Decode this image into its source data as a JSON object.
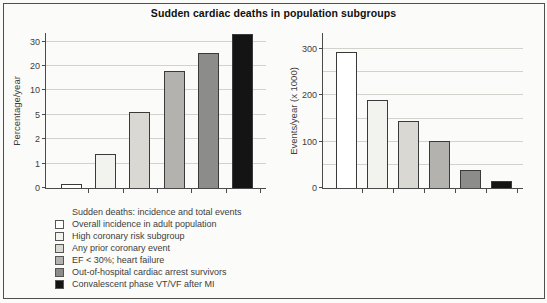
{
  "title": "Sudden cardiac deaths in population subgroups",
  "legend": {
    "header": "Sudden deaths: incidence and total events",
    "items": [
      {
        "label": "Overall incidence in adult population",
        "color": "#ffffff"
      },
      {
        "label": "High coronary risk subgroup",
        "color": "#f2f2ee"
      },
      {
        "label": "Any prior coronary event",
        "color": "#d9d8d3"
      },
      {
        "label": "EF < 30%; heart failure",
        "color": "#b3b2ae"
      },
      {
        "label": "Out-of-hospital cardiac arrest survivors",
        "color": "#8c8c8a"
      },
      {
        "label": "Convalescent phase VT/VF after MI",
        "color": "#141414"
      }
    ]
  },
  "colors": {
    "background": "#fbfbf9",
    "frame_border": "#4f4f4f",
    "axis": "#4a4a4a",
    "grid": "#d2d2cd",
    "text": "#3d3d3d",
    "title": "#101010",
    "bar_border": "#3a3a3a",
    "bar_fills": [
      "#ffffff",
      "#f2f2ee",
      "#d9d8d3",
      "#b3b2ae",
      "#8c8c8a",
      "#141414"
    ]
  },
  "chart_data": [
    {
      "type": "bar",
      "title": "Sudden cardiac deaths in population subgroups",
      "ylabel": "Percentage/year",
      "xlabel": "",
      "categories": [
        "Overall incidence in adult population",
        "High coronary risk subgroup",
        "Any prior coronary event",
        "EF < 30%; heart failure",
        "Out-of-hospital cardiac arrest survivors",
        "Convalescent phase VT/VF after MI"
      ],
      "values": [
        0.15,
        1.4,
        5.5,
        18,
        25.5,
        33
      ],
      "yticks": [
        0,
        1,
        2,
        5,
        10,
        20,
        30
      ],
      "axis_note": "non-linear scale: tick values 0,1,2,5,10,20,30 are equally spaced",
      "grid": true,
      "legend_position": "below"
    },
    {
      "type": "bar",
      "title": "",
      "ylabel": "Events/year (x 1000)",
      "xlabel": "",
      "categories": [
        "Overall incidence in adult population",
        "High coronary risk subgroup",
        "Any prior coronary event",
        "EF < 30%; heart failure",
        "Out-of-hospital cardiac arrest survivors",
        "Convalescent phase VT/VF after MI"
      ],
      "values": [
        295,
        190,
        145,
        102,
        38,
        15
      ],
      "yticks": [
        0,
        100,
        200,
        300
      ],
      "gridlines": [
        50,
        100,
        150,
        200,
        250,
        300
      ],
      "ylim": [
        0,
        335
      ],
      "grid": true,
      "legend_position": "below"
    }
  ]
}
